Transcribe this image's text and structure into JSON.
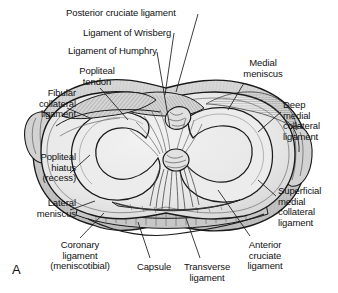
{
  "figure": {
    "panel_letter": "A",
    "colors": {
      "outline": "#1a1a1a",
      "cartilage_fill": "#e9e9e9",
      "meniscus_fill": "#d9d9d9",
      "capsule_fill": "#cfcfcf",
      "ligament_fill": "#c8c8c8",
      "background": "#ffffff",
      "label_text": "#111111",
      "leader_line": "#1a1a1a"
    }
  },
  "labels": [
    {
      "id": "posterior-cruciate-ligament",
      "text": "Posterior cruciate ligament",
      "align": "left",
      "x": 66,
      "y": 8,
      "width": 170
    },
    {
      "id": "ligament-of-wrisberg",
      "text": "Ligament of Wrisberg",
      "align": "left",
      "x": 83,
      "y": 28,
      "width": 150
    },
    {
      "id": "ligament-of-humphry",
      "text": "Ligament of Humphry",
      "align": "left",
      "x": 68,
      "y": 46,
      "width": 150
    },
    {
      "id": "popliteal-tendon",
      "text": "Popliteal\ntendon",
      "align": "center",
      "x": 62,
      "y": 66,
      "width": 70
    },
    {
      "id": "medial-meniscus",
      "text": "Medial\nmeniscus",
      "align": "center",
      "x": 228,
      "y": 58,
      "width": 70
    },
    {
      "id": "fibular-collateral-ligament",
      "text": "Fibular\ncollateral\nligament",
      "align": "right",
      "x": 2,
      "y": 88,
      "width": 74
    },
    {
      "id": "deep-medial-collateral-ligament",
      "text": "Deep\nmedial\ncollateral\nligament",
      "align": "left",
      "x": 283,
      "y": 100,
      "width": 58
    },
    {
      "id": "popliteal-hiatus-recess",
      "text": "Popliteal\nhiatus\n(recess)",
      "align": "right",
      "x": 2,
      "y": 152,
      "width": 74
    },
    {
      "id": "superficial-medial-collateral-ligament",
      "text": "Superficial\nmedial\ncollateral\nligament",
      "align": "left",
      "x": 278,
      "y": 186,
      "width": 66
    },
    {
      "id": "lateral-meniscus",
      "text": "Lateral\nmeniscus",
      "align": "right",
      "x": 2,
      "y": 198,
      "width": 74
    },
    {
      "id": "coronary-ligament-meniscotibial",
      "text": "Coronary\nligament\n(meniscotibial)",
      "align": "center",
      "x": 30,
      "y": 240,
      "width": 100
    },
    {
      "id": "capsule",
      "text": "Capsule",
      "align": "center",
      "x": 128,
      "y": 262,
      "width": 52
    },
    {
      "id": "transverse-ligament",
      "text": "Transverse\nligament",
      "align": "center",
      "x": 176,
      "y": 262,
      "width": 62
    },
    {
      "id": "anterior-cruciate-ligament",
      "text": "Anterior\ncruciate\nligament",
      "align": "center",
      "x": 235,
      "y": 240,
      "width": 60
    }
  ],
  "leader_lines": [
    {
      "id": "leader-posterior-cruciate-ligament",
      "points": "198,14 176,92"
    },
    {
      "id": "leader-ligament-of-wrisberg",
      "points": "174,33 165,95"
    },
    {
      "id": "leader-ligament-of-humphry",
      "points": "157,52 170,128"
    },
    {
      "id": "leader-popliteal-tendon",
      "points": "100,88 128,120"
    },
    {
      "id": "leader-medial-meniscus",
      "points": "244,83 228,110"
    },
    {
      "id": "leader-fibular-collateral-ligament",
      "points": "67,108 90,118"
    },
    {
      "id": "leader-deep-medial-collateral-ligament",
      "points": "281,112 258,132"
    },
    {
      "id": "leader-popliteal-hiatus",
      "points": "70,173 90,155"
    },
    {
      "id": "leader-superficial-mcl",
      "points": "276,196 258,180"
    },
    {
      "id": "leader-lateral-meniscus",
      "points": "70,210 95,201"
    },
    {
      "id": "leader-coronary-ligament",
      "points": "80,238 104,213"
    },
    {
      "id": "leader-capsule",
      "points": "150,258 138,222"
    },
    {
      "id": "leader-transverse-ligament",
      "points": "200,258 186,218"
    },
    {
      "id": "leader-anterior-cruciate-ligament",
      "points": "250,236 218,190"
    }
  ]
}
